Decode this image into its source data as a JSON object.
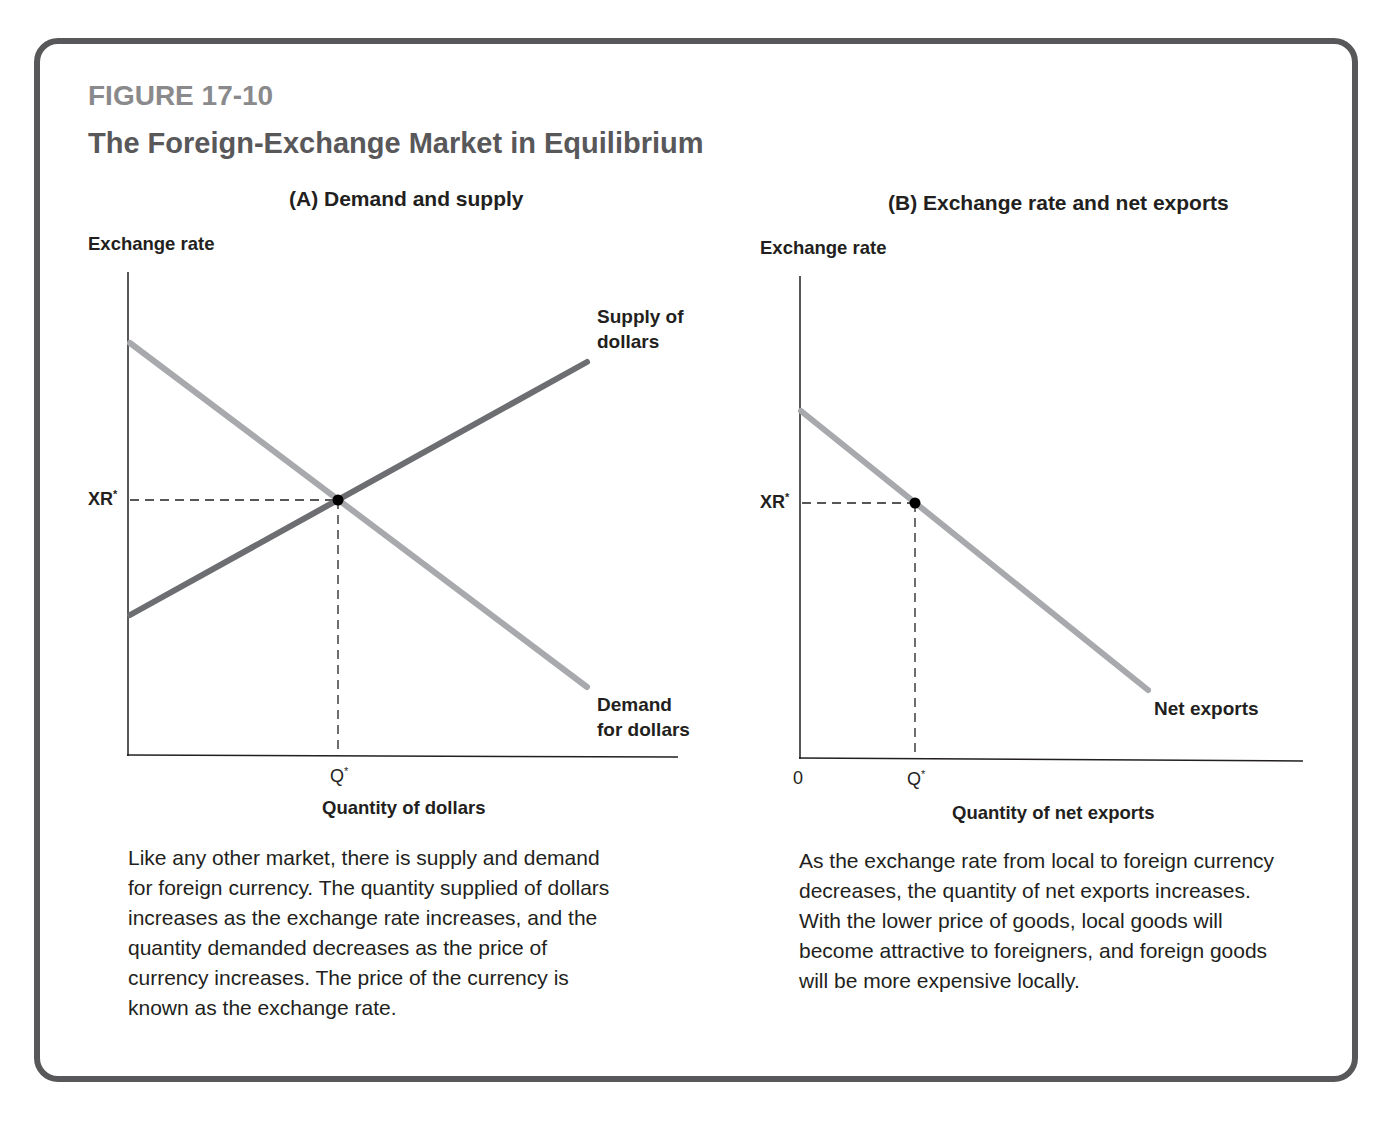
{
  "figure": {
    "label": "FIGURE 17-10",
    "title": "The Foreign-Exchange Market in Equilibrium",
    "frame_color": "#58585a",
    "label_color": "#8a8a8c"
  },
  "panel_a": {
    "title": "(A) Demand and supply",
    "ylabel": "Exchange rate",
    "xlabel": "Quantity of dollars",
    "xr_label": "XR*",
    "q_label": "Q*",
    "supply_label_line1": "Supply of",
    "supply_label_line2": "dollars",
    "demand_label_line1": "Demand",
    "demand_label_line2": "for dollars",
    "caption": "Like any other market, there is supply and demand for foreign currency. The quantity supplied of dollars increases as the exchange rate increases, and the quantity demanded decreases as the price of currency increases. The price of the currency is known as the exchange rate."
  },
  "panel_b": {
    "title": "(B) Exchange rate and net exports",
    "ylabel": "Exchange rate",
    "xlabel": "Quantity of net exports",
    "xr_label": "XR*",
    "q_label": "Q*",
    "origin_label": "0",
    "curve_label": "Net exports",
    "caption": "As the exchange rate from local to foreign currency decreases, the quantity of net exports increases. With the lower price of goods, local goods will become attractive to foreigners, and foreign goods will be more expensive locally."
  },
  "colors": {
    "supply": "#6d6e71",
    "demand": "#a7a9ac",
    "net_exports": "#a7a9ac",
    "axis": "#231f20",
    "equilibrium_point": "#000000"
  },
  "chart_data": [
    {
      "type": "line",
      "title": "(A) Demand and supply",
      "xlabel": "Quantity of dollars",
      "ylabel": "Exchange rate",
      "xlim": [
        0,
        100
      ],
      "ylim": [
        0,
        100
      ],
      "grid": false,
      "x_ticks": [
        "Q*"
      ],
      "y_ticks": [
        "XR*"
      ],
      "series": [
        {
          "name": "Supply of dollars",
          "x": [
            0,
            83
          ],
          "y": [
            29,
            82
          ]
        },
        {
          "name": "Demand for dollars",
          "x": [
            0,
            83
          ],
          "y": [
            85,
            14
          ]
        }
      ],
      "annotations": [
        {
          "label": "Equilibrium",
          "x": 38,
          "y": 53,
          "xlabel": "Q*",
          "ylabel": "XR*",
          "dashed_guides": true
        }
      ]
    },
    {
      "type": "line",
      "title": "(B) Exchange rate and net exports",
      "xlabel": "Quantity of net exports",
      "ylabel": "Exchange rate",
      "xlim": [
        0,
        100
      ],
      "ylim": [
        0,
        100
      ],
      "grid": false,
      "x_ticks": [
        "0",
        "Q*"
      ],
      "y_ticks": [
        "XR*"
      ],
      "series": [
        {
          "name": "Net exports",
          "x": [
            0,
            69
          ],
          "y": [
            72,
            14
          ]
        }
      ],
      "annotations": [
        {
          "label": "Equilibrium",
          "x": 23,
          "y": 53,
          "xlabel": "Q*",
          "ylabel": "XR*",
          "dashed_guides": true
        }
      ]
    }
  ]
}
